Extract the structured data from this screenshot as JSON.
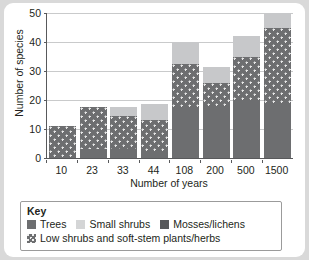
{
  "chart_data": {
    "type": "bar",
    "subtype": "stacked-bar",
    "title": "",
    "xlabel": "Number of years",
    "ylabel": "Number of species",
    "categories": [
      "10",
      "23",
      "33",
      "44",
      "108",
      "200",
      "500",
      "1500"
    ],
    "ylim": [
      0,
      50
    ],
    "yticks": [
      0,
      10,
      20,
      30,
      40,
      50
    ],
    "grid": true,
    "legend_position": "below-plot",
    "series": [
      {
        "name": "Trees",
        "key": "trees",
        "color": "#6d6e70",
        "pattern": "solid",
        "values": [
          0,
          3,
          3,
          2,
          17.5,
          17.5,
          20,
          19
        ]
      },
      {
        "name": "Low shrubs and soft-stem plants/herbs",
        "key": "low_shrubs",
        "color": "#6d6e70",
        "pattern": "dotted",
        "values": [
          11,
          14.5,
          11.5,
          11,
          15,
          8.5,
          15,
          26
        ]
      },
      {
        "name": "Small shrubs",
        "key": "small_shrubs",
        "color": "#c7c8ca",
        "pattern": "solid",
        "values": [
          0,
          0,
          3,
          5.5,
          7.5,
          5.5,
          7,
          5
        ]
      },
      {
        "name": "Mosses/lichens",
        "key": "mosses_lichens",
        "color": "#58595b",
        "pattern": "solid",
        "values": [
          0,
          0,
          0,
          0,
          0,
          0,
          0,
          0
        ]
      }
    ],
    "totals": [
      11,
      17.5,
      17.5,
      18.5,
      40,
      31.5,
      42,
      50
    ]
  },
  "legend": {
    "title": "Key",
    "items": [
      {
        "label": "Trees",
        "swatch": "trees-swatch"
      },
      {
        "label": "Small shrubs",
        "swatch": "small-shrubs-swatch"
      },
      {
        "label": "Mosses/lichens",
        "swatch": "mosses-lichens-swatch"
      },
      {
        "label": "Low shrubs and soft-stem plants/herbs",
        "swatch": "low-shrubs-swatch"
      }
    ]
  }
}
